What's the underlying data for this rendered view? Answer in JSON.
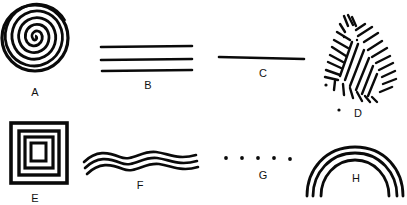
{
  "figure": {
    "background": "#ffffff",
    "ink": "#0a0a0a",
    "panels": [
      {
        "id": "A",
        "label": "A",
        "shape": "concentric spiral circle"
      },
      {
        "id": "B",
        "label": "B",
        "shape": "three parallel horizontal lines"
      },
      {
        "id": "C",
        "label": "C",
        "shape": "single horizontal line"
      },
      {
        "id": "D",
        "label": "D",
        "shape": "hatched irregular blob"
      },
      {
        "id": "E",
        "label": "E",
        "shape": "nested squares"
      },
      {
        "id": "F",
        "label": "F",
        "shape": "three wavy lines"
      },
      {
        "id": "G",
        "label": "G",
        "shape": "row of five dots"
      },
      {
        "id": "H",
        "label": "H",
        "shape": "three concentric arcs (rainbow)"
      }
    ]
  }
}
